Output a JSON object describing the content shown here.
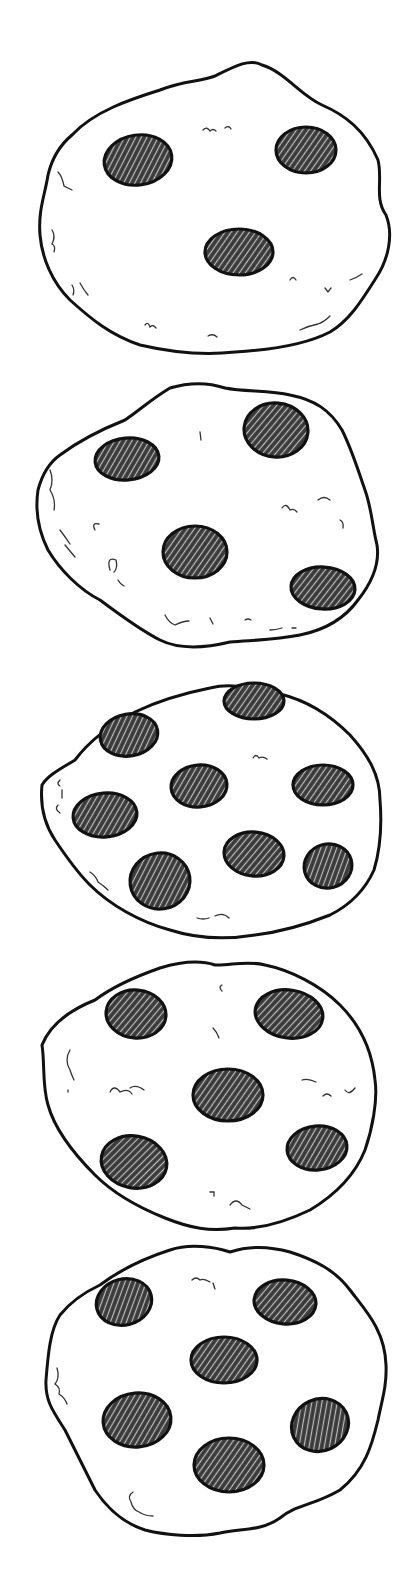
{
  "illustration": {
    "title": "Five chocolate chip cookies",
    "background": "#ffffff",
    "stroke_color": "#111111",
    "chip_fill": "#3a3a3a",
    "chip_hatch": "#bdbdbd",
    "cookies": [
      {
        "label": "cookie-1",
        "chip_count": 3,
        "outline": "M 72 135 C 95 110 135 98 160 90 C 185 80 200 82 215 76 C 235 66 250 58 262 65 C 285 72 300 95 322 105 C 345 115 365 130 378 160 C 383 180 374 198 386 215 C 394 235 388 260 376 278 C 362 300 350 320 330 332 C 305 345 270 350 235 352 C 200 356 170 352 140 345 C 110 335 90 318 70 300 C 52 282 42 258 40 235 C 38 210 45 195 48 175 C 52 158 60 145 72 135 Z",
        "chips": [
          {
            "cx": 138,
            "cy": 160,
            "rx": 34,
            "ry": 25,
            "rot": -8
          },
          {
            "cx": 306,
            "cy": 150,
            "rx": 30,
            "ry": 23,
            "rot": 0
          },
          {
            "cx": 239,
            "cy": 252,
            "rx": 34,
            "ry": 23,
            "rot": 0
          }
        ],
        "crumbs": [
          "M 203 130 q 4 -4 7 1 q 3 -3 6 0 M 225 128 q 4 -3 6 1",
          "M 290 280 q 3 -5 6 0",
          "M 325 288 l 3 4 l 3 -4",
          "M 350 280 q 6 -2 12 -6",
          "M 145 325 q 3 -4 5 2 q 3 -3 6 1",
          "M 208 336 q 5 -3 9 1",
          "M 58 172 q 4 4 6 14 q 4 2 8 4",
          "M 52 230 q 4 6 0 14 q 4 2 2 8",
          "M 72 285 q 3 5 1 10 M 80 283 q 3 6 8 12",
          "M 300 330 q 8 -4 18 -6 q 6 -2 12 -8"
        ]
      },
      {
        "label": "cookie-2",
        "chip_count": 4,
        "outline": "M 60 455 C 80 440 100 430 125 420 C 140 410 150 400 170 388 C 190 382 210 383 225 388 C 245 392 270 390 290 395 C 315 400 330 410 342 430 C 352 450 358 470 365 490 C 372 510 372 525 377 545 C 380 565 370 585 358 600 C 345 618 325 630 300 635 C 275 640 255 640 230 642 C 205 648 180 650 160 640 C 140 630 120 615 100 600 C 80 590 60 570 48 550 C 38 530 35 510 38 490 C 42 475 50 462 60 455 Z",
        "chips": [
          {
            "cx": 127,
            "cy": 459,
            "rx": 32,
            "ry": 21,
            "rot": -5
          },
          {
            "cx": 276,
            "cy": 430,
            "rx": 32,
            "ry": 27,
            "rot": 5
          },
          {
            "cx": 195,
            "cy": 552,
            "rx": 32,
            "ry": 26,
            "rot": 0
          },
          {
            "cx": 323,
            "cy": 588,
            "rx": 32,
            "ry": 21,
            "rot": 3
          }
        ],
        "crumbs": [
          "M 200 432 l 1 8",
          "M 282 508 q 4 -6 8 2 q 4 -2 7 2",
          "M 318 500 q 6 -5 12 0",
          "M 340 520 q 4 2 3 8",
          "M 95 530 q -4 -8 4 -6",
          "M 110 570 q -4 -14 6 -10 q 2 8 -2 12 M 118 580 q 2 4 6 6",
          "M 50 470 q 4 10 0 20 q 6 10 4 20",
          "M 60 530 q 6 8 10 14 M 65 545 q 5 6 10 12",
          "M 165 615 q 4 8 10 10 q 8 -4 14 -4",
          "M 210 618 l 3 6",
          "M 245 620 q 3 -2 6 0",
          "M 270 630 q 6 0 12 -2 M 292 628 l 4 0"
        ]
      },
      {
        "label": "cookie-3",
        "chip_count": 7,
        "outline": "M 75 760 C 90 740 110 725 135 712 C 160 700 185 693 210 688 C 235 682 255 690 280 694 C 305 700 330 715 350 735 C 368 755 380 775 380 800 C 382 825 380 850 374 870 C 365 890 350 905 330 915 C 305 925 280 932 255 935 C 225 940 195 938 170 930 C 140 922 110 905 90 885 C 75 870 65 855 55 840 C 45 825 40 805 42 785 C 48 775 62 768 75 760 Z",
        "chips": [
          {
            "cx": 129,
            "cy": 735,
            "rx": 29,
            "ry": 21,
            "rot": -10
          },
          {
            "cx": 254,
            "cy": 701,
            "rx": 30,
            "ry": 18,
            "rot": 0
          },
          {
            "cx": 199,
            "cy": 786,
            "rx": 28,
            "ry": 21,
            "rot": -5
          },
          {
            "cx": 323,
            "cy": 785,
            "rx": 30,
            "ry": 20,
            "rot": 0
          },
          {
            "cx": 105,
            "cy": 815,
            "rx": 32,
            "ry": 22,
            "rot": -5
          },
          {
            "cx": 254,
            "cy": 854,
            "rx": 30,
            "ry": 22,
            "rot": 5
          },
          {
            "cx": 160,
            "cy": 881,
            "rx": 30,
            "ry": 28,
            "rot": -8
          },
          {
            "cx": 328,
            "cy": 866,
            "rx": 24,
            "ry": 22,
            "rot": -15
          }
        ],
        "crumbs": [
          "M 253 758 q 3 -5 6 0 q 4 -2 8 1",
          "M 60 780 q -4 4 0 6 M 62 790 l 0 8 M 58 805 q -4 4 2 8",
          "M 90 872 q 6 4 8 10 q 6 4 10 8",
          "M 197 918 q 6 2 12 0 M 215 916 q 8 -4 14 2"
        ]
      },
      {
        "label": "cookie-4",
        "chip_count": 5,
        "outline": "M 95 1000 C 115 985 140 975 160 968 C 180 962 200 960 215 965 C 230 966 245 960 265 965 C 290 970 320 985 340 1005 C 360 1025 372 1050 375 1080 C 378 1100 372 1130 365 1150 C 355 1175 335 1195 310 1210 C 285 1222 260 1230 235 1228 C 210 1232 190 1228 165 1218 C 140 1208 115 1195 95 1175 C 75 1155 55 1130 48 1105 C 42 1085 45 1065 42 1045 C 50 1025 70 1010 95 1000 Z",
        "chips": [
          {
            "cx": 136,
            "cy": 1014,
            "rx": 30,
            "ry": 24,
            "rot": 5
          },
          {
            "cx": 289,
            "cy": 1014,
            "rx": 34,
            "ry": 24,
            "rot": 8
          },
          {
            "cx": 228,
            "cy": 1095,
            "rx": 35,
            "ry": 26,
            "rot": 0
          },
          {
            "cx": 134,
            "cy": 1162,
            "rx": 33,
            "ry": 26,
            "rot": 10
          },
          {
            "cx": 317,
            "cy": 1148,
            "rx": 30,
            "ry": 22,
            "rot": -5
          }
        ],
        "crumbs": [
          "M 222 985 q -4 2 0 6",
          "M 213 1028 q 4 4 6 10",
          "M 70 1050 q -6 10 0 20 q 2 6 4 10 M 68 1090 l 0 2",
          "M 110 1092 q 4 -8 10 0 q 8 -4 12 2 M 130 1088 q 6 -4 14 2",
          "M 302 1080 q 6 -2 14 2 M 323 1096 q 4 -4 8 0 M 345 1090 q 4 6 10 -2",
          "M 210 1192 l 4 0 l 0 4 M 230 1205 q 6 -8 12 0 q 4 2 8 4"
        ]
      },
      {
        "label": "cookie-5",
        "chip_count": 6,
        "outline": "M 100 1285 C 120 1270 145 1258 170 1250 C 190 1243 215 1247 230 1252 C 245 1247 265 1245 290 1252 C 315 1260 335 1270 350 1290 C 365 1310 385 1330 386 1365 C 387 1385 382 1400 378 1420 C 372 1445 365 1470 340 1490 C 315 1505 295 1505 280 1518 C 260 1532 240 1528 220 1533 C 195 1538 165 1535 145 1530 C 120 1522 105 1505 95 1490 C 85 1470 75 1450 65 1430 C 52 1410 45 1400 46 1380 C 48 1355 50 1330 60 1315 C 72 1300 85 1292 100 1285 Z",
        "chips": [
          {
            "cx": 124,
            "cy": 1302,
            "rx": 28,
            "ry": 23,
            "rot": -15
          },
          {
            "cx": 285,
            "cy": 1302,
            "rx": 31,
            "ry": 22,
            "rot": 5
          },
          {
            "cx": 224,
            "cy": 1360,
            "rx": 33,
            "ry": 23,
            "rot": 0
          },
          {
            "cx": 137,
            "cy": 1420,
            "rx": 34,
            "ry": 27,
            "rot": -5
          },
          {
            "cx": 320,
            "cy": 1425,
            "rx": 29,
            "ry": 26,
            "rot": -25
          },
          {
            "cx": 229,
            "cy": 1465,
            "rx": 35,
            "ry": 27,
            "rot": 0
          }
        ],
        "crumbs": [
          "M 192 1280 q 4 -4 8 0 q 4 -2 10 2 M 213 1283 l 2 6",
          "M 57 1368 q 3 10 -2 16 q 6 4 4 10 q 6 4 8 10",
          "M 133 1492 q -6 4 -2 10 q 2 8 8 10 q 6 4 14 4"
        ]
      }
    ]
  }
}
